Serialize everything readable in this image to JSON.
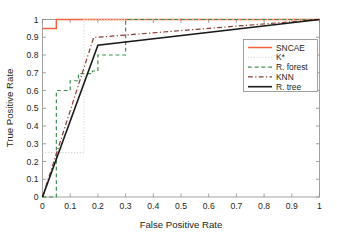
{
  "chart_data": {
    "type": "line",
    "title": "",
    "xlabel": "False Positive Rate",
    "ylabel": "True Positive Rate",
    "xlim": [
      0,
      1
    ],
    "ylim": [
      0,
      1
    ],
    "grid": false,
    "legend_position": "right",
    "xticks": [
      "0",
      "0.1",
      "0.2",
      "0.3",
      "0.4",
      "0.5",
      "0.6",
      "0.7",
      "0.8",
      "0.9",
      "1"
    ],
    "xtick_values": [
      0,
      0.1,
      0.2,
      0.3,
      0.4,
      0.5,
      0.6,
      0.7,
      0.8,
      0.9,
      1
    ],
    "yticks": [
      "0",
      "0.1",
      "0.2",
      "0.3",
      "0.4",
      "0.5",
      "0.6",
      "0.7",
      "0.8",
      "0.9",
      "1"
    ],
    "ytick_values": [
      0,
      0.1,
      0.2,
      0.3,
      0.4,
      0.5,
      0.6,
      0.7,
      0.8,
      0.9,
      1
    ],
    "series": [
      {
        "name": "SNCAE",
        "color": "#f4603e",
        "dash": "none",
        "width": 1.5,
        "x": [
          0,
          0.05,
          0.05,
          1
        ],
        "y": [
          0.95,
          0.95,
          1.0,
          1.0
        ]
      },
      {
        "name": "K*",
        "color": "#d8d4cf",
        "dash": "dotted",
        "width": 1.1,
        "x": [
          0,
          0.02,
          0.15,
          0.15,
          1
        ],
        "y": [
          0.25,
          0.25,
          0.25,
          1.0,
          1.0
        ]
      },
      {
        "name": "R. forest",
        "color": "#3f8f4f",
        "dash": "dashed",
        "width": 1.2,
        "x": [
          0,
          0.05,
          0.05,
          0.1,
          0.1,
          0.13,
          0.13,
          0.18,
          0.18,
          0.2,
          0.2,
          0.3,
          0.3,
          1
        ],
        "y": [
          0,
          0,
          0.6,
          0.6,
          0.655,
          0.655,
          0.695,
          0.695,
          0.71,
          0.71,
          0.8,
          0.8,
          1.0,
          1.0
        ]
      },
      {
        "name": "KNN",
        "color": "#8a3b32",
        "dash": "dashdot",
        "width": 1.2,
        "x": [
          0,
          0.185,
          0.2,
          1
        ],
        "y": [
          0,
          0.9,
          0.9,
          1.0
        ]
      },
      {
        "name": "R. tree",
        "color": "#1a1a1a",
        "dash": "none",
        "width": 1.6,
        "x": [
          0,
          0.2,
          1
        ],
        "y": [
          0,
          0.855,
          1.0
        ]
      }
    ]
  },
  "legend": {
    "entries": [
      {
        "label": "SNCAE"
      },
      {
        "label": "K*"
      },
      {
        "label": "R. forest"
      },
      {
        "label": "KNN"
      },
      {
        "label": "R. tree"
      }
    ]
  }
}
